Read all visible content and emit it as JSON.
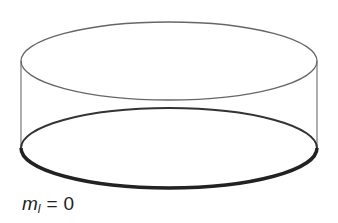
{
  "figure": {
    "type": "cylinder-orbital-diagram",
    "label": {
      "symbol": "m",
      "subscript": "l",
      "equals": "=",
      "value": "0"
    },
    "colors": {
      "outline": "#666666",
      "bottom_ring": "#222222",
      "background": "#ffffff"
    }
  }
}
